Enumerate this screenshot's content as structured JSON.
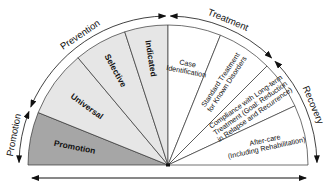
{
  "diagram": {
    "phases": [
      {
        "id": "promotion",
        "label": "Promotion"
      },
      {
        "id": "prevention",
        "label": "Prevention"
      },
      {
        "id": "treatment",
        "label": "Treatment"
      },
      {
        "id": "recovery",
        "label": "Recovery"
      }
    ],
    "segments": [
      {
        "id": "promotion",
        "lines": [
          "Promotion"
        ],
        "fill": "#a6a6a6",
        "phase": "promotion"
      },
      {
        "id": "universal",
        "lines": [
          "Universal"
        ],
        "fill": "#e6e6e6",
        "phase": "prevention"
      },
      {
        "id": "selective",
        "lines": [
          "Selective"
        ],
        "fill": "#e6e6e6",
        "phase": "prevention"
      },
      {
        "id": "indicated",
        "lines": [
          "Indicated"
        ],
        "fill": "#e6e6e6",
        "phase": "prevention"
      },
      {
        "id": "case-identification",
        "lines": [
          "Case",
          "Identification"
        ],
        "fill": "#ffffff",
        "phase": "treatment"
      },
      {
        "id": "standard-treatment",
        "lines": [
          "Standard Treatment",
          "for Known Disorders"
        ],
        "fill": "#ffffff",
        "phase": "treatment"
      },
      {
        "id": "compliance",
        "lines": [
          "Compliance with Long-term",
          "Treatment (Goal: Reduction",
          "in Relapse and Recurrence)"
        ],
        "fill": "#ffffff",
        "phase": "recovery"
      },
      {
        "id": "after-care",
        "lines": [
          "After-care",
          "(Including Rehabilitation)"
        ],
        "fill": "#ffffff",
        "phase": "recovery"
      }
    ],
    "colors": {
      "stroke": "#333333",
      "promotion_fill": "#a6a6a6",
      "prevention_fill": "#e6e6e6",
      "treatment_fill": "#ffffff"
    }
  }
}
